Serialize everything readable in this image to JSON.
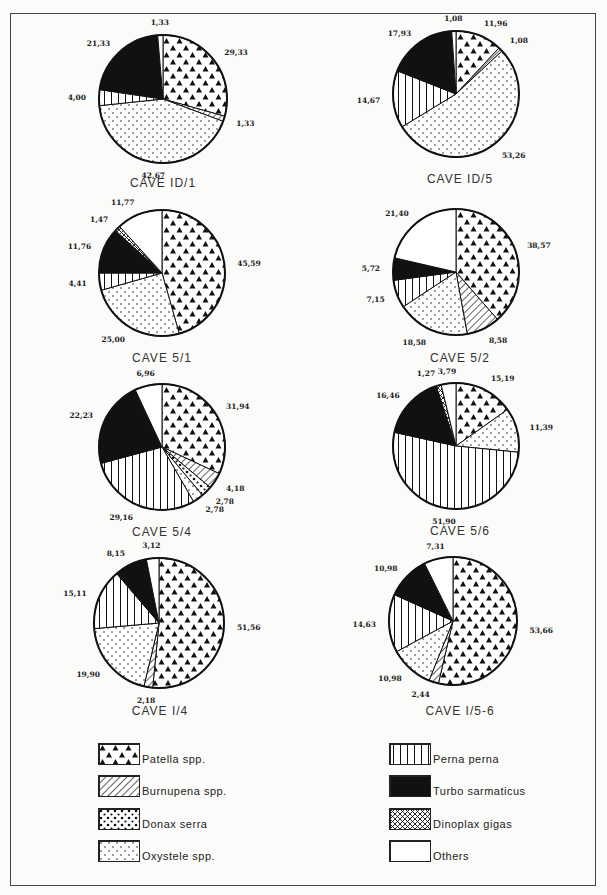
{
  "categories_order": [
    "Patella spp.",
    "Burnupena spp.",
    "Donax serra",
    "Oxystele spp.",
    "Perna perna",
    "Turbo sarmaticus",
    "Dinoplax gigas",
    "Others"
  ],
  "legend": [
    {
      "key": "patella",
      "label": "Patella spp.",
      "pattern": "triangles"
    },
    {
      "key": "burnupena",
      "label": "Burnupena spp.",
      "pattern": "diagonal-hatch"
    },
    {
      "key": "donax",
      "label": "Donax serra",
      "pattern": "large-dots"
    },
    {
      "key": "oxystele",
      "label": "Oxystele spp.",
      "pattern": "small-dots"
    },
    {
      "key": "perna",
      "label": "Perna  perna",
      "pattern": "vertical-lines"
    },
    {
      "key": "turbo",
      "label": "Turbo sarmaticus",
      "pattern": "solid-black"
    },
    {
      "key": "dinoplax",
      "label": "Dinoplax  gigas",
      "pattern": "cross-hatch"
    },
    {
      "key": "others",
      "label": "Others",
      "pattern": "white"
    }
  ],
  "chart_data": [
    {
      "type": "pie",
      "title": "CAVE ID/1",
      "caption": "CAVE  ID/1",
      "slices": [
        {
          "key": "patella",
          "value": 29.33,
          "label": "29,33"
        },
        {
          "key": "burnupena",
          "value": 1.33,
          "label": "1,33"
        },
        {
          "key": "oxystele",
          "value": 42.67,
          "label": "42,67"
        },
        {
          "key": "perna",
          "value": 4.0,
          "label": "4,00"
        },
        {
          "key": "turbo",
          "value": 21.33,
          "label": "21,33"
        },
        {
          "key": "others",
          "value": 1.33,
          "label": "1,33"
        }
      ]
    },
    {
      "type": "pie",
      "title": "CAVE ID/5",
      "caption": "CAVE  ID/5",
      "slices": [
        {
          "key": "patella",
          "value": 11.96,
          "label": "11,96"
        },
        {
          "key": "burnupena",
          "value": 1.08,
          "label": "1,08"
        },
        {
          "key": "oxystele",
          "value": 53.26,
          "label": "53,26"
        },
        {
          "key": "perna",
          "value": 14.67,
          "label": "14,67"
        },
        {
          "key": "turbo",
          "value": 17.93,
          "label": "17,93"
        },
        {
          "key": "others",
          "value": 1.08,
          "label": "1,08"
        }
      ]
    },
    {
      "type": "pie",
      "title": "CAVE 5/1",
      "caption": "CAVE   5/1",
      "slices": [
        {
          "key": "patella",
          "value": 45.59,
          "label": "45,59"
        },
        {
          "key": "oxystele",
          "value": 25.0,
          "label": "25,00"
        },
        {
          "key": "perna",
          "value": 4.41,
          "label": "4,41"
        },
        {
          "key": "turbo",
          "value": 11.76,
          "label": "11,76"
        },
        {
          "key": "dinoplax",
          "value": 1.47,
          "label": "1,47"
        },
        {
          "key": "others",
          "value": 11.77,
          "label": "11,77"
        }
      ]
    },
    {
      "type": "pie",
      "title": "CAVE 5/2",
      "caption": "CAVE  5/2",
      "slices": [
        {
          "key": "patella",
          "value": 38.57,
          "label": "38,57"
        },
        {
          "key": "burnupena",
          "value": 8.58,
          "label": "8,58"
        },
        {
          "key": "oxystele",
          "value": 18.58,
          "label": "18,58"
        },
        {
          "key": "perna",
          "value": 7.15,
          "label": "7,15"
        },
        {
          "key": "turbo",
          "value": 5.72,
          "label": "5,72"
        },
        {
          "key": "others",
          "value": 21.4,
          "label": "21,40"
        }
      ]
    },
    {
      "type": "pie",
      "title": "CAVE 5/4",
      "caption": "CAVE  5/4",
      "slices": [
        {
          "key": "patella",
          "value": 31.94,
          "label": "31,94"
        },
        {
          "key": "burnupena",
          "value": 4.18,
          "label": "4,18"
        },
        {
          "key": "donax",
          "value": 2.78,
          "label": "2,78"
        },
        {
          "key": "oxystele",
          "value": 2.78,
          "label": "2,78"
        },
        {
          "key": "perna",
          "value": 29.16,
          "label": "29,16"
        },
        {
          "key": "turbo",
          "value": 22.23,
          "label": "22,23"
        },
        {
          "key": "others",
          "value": 6.96,
          "label": "6,96"
        }
      ]
    },
    {
      "type": "pie",
      "title": "CAVE 5/6",
      "caption": "CAVE  5/6",
      "slices": [
        {
          "key": "patella",
          "value": 15.19,
          "label": "15,19"
        },
        {
          "key": "oxystele",
          "value": 11.39,
          "label": "11,39"
        },
        {
          "key": "perna",
          "value": 51.9,
          "label": "51,90"
        },
        {
          "key": "turbo",
          "value": 16.46,
          "label": "16,46"
        },
        {
          "key": "dinoplax",
          "value": 1.27,
          "label": "1,27"
        },
        {
          "key": "others",
          "value": 3.79,
          "label": "3,79"
        }
      ]
    },
    {
      "type": "pie",
      "title": "CAVE I/4",
      "caption": "CAVE  I/4",
      "slices": [
        {
          "key": "patella",
          "value": 51.56,
          "label": "51,56"
        },
        {
          "key": "burnupena",
          "value": 2.18,
          "label": "2,18"
        },
        {
          "key": "oxystele",
          "value": 19.9,
          "label": "19,90"
        },
        {
          "key": "perna",
          "value": 15.11,
          "label": "15,11"
        },
        {
          "key": "turbo",
          "value": 8.15,
          "label": "8,15"
        },
        {
          "key": "others",
          "value": 3.12,
          "label": "3,12"
        }
      ]
    },
    {
      "type": "pie",
      "title": "CAVE I/5-6",
      "caption": "CAVE  I/5-6",
      "slices": [
        {
          "key": "patella",
          "value": 53.66,
          "label": "53,66"
        },
        {
          "key": "burnupena",
          "value": 2.44,
          "label": "2,44"
        },
        {
          "key": "oxystele",
          "value": 10.98,
          "label": "10,98"
        },
        {
          "key": "perna",
          "value": 14.63,
          "label": "14,63"
        },
        {
          "key": "turbo",
          "value": 10.98,
          "label": "10,98"
        },
        {
          "key": "others",
          "value": 7.31,
          "label": "7,31"
        }
      ]
    }
  ]
}
